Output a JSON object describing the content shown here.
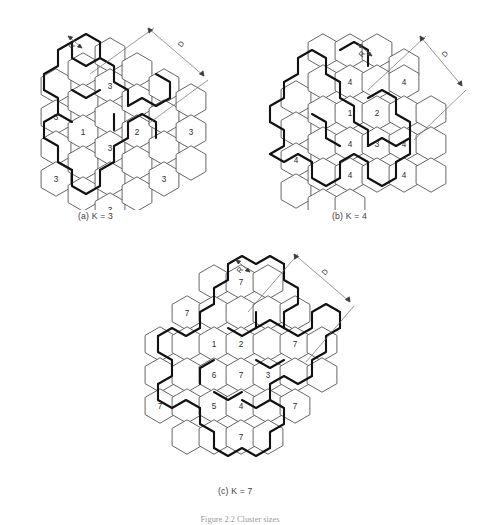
{
  "figure": {
    "caption": "Figure 2.2 Cluster sizes",
    "panels": [
      {
        "id": "a",
        "caption": "(a) K = 3",
        "cluster_size": 3,
        "dim_r_label": "R",
        "dim_d_label": "D",
        "origin": {
          "x": 8,
          "y": 14
        },
        "hex_radius": 17.2,
        "grid": {
          "col_step": 26.5,
          "row_step": 15.6
        },
        "cells": [
          {
            "cx": 48,
            "cy": 72,
            "label": ""
          },
          {
            "cx": 48,
            "cy": 103,
            "label": "3"
          },
          {
            "cx": 48,
            "cy": 134,
            "label": ""
          },
          {
            "cx": 48,
            "cy": 165,
            "label": "3"
          },
          {
            "cx": 75,
            "cy": 56,
            "label": ""
          },
          {
            "cx": 75,
            "cy": 87,
            "label": ""
          },
          {
            "cx": 75,
            "cy": 118,
            "label": "1"
          },
          {
            "cx": 75,
            "cy": 149,
            "label": ""
          },
          {
            "cx": 75,
            "cy": 180,
            "label": ""
          },
          {
            "cx": 102,
            "cy": 41,
            "label": ""
          },
          {
            "cx": 102,
            "cy": 72,
            "label": "3"
          },
          {
            "cx": 102,
            "cy": 103,
            "label": ""
          },
          {
            "cx": 102,
            "cy": 134,
            "label": "3"
          },
          {
            "cx": 102,
            "cy": 165,
            "label": ""
          },
          {
            "cx": 102,
            "cy": 196,
            "label": "3"
          },
          {
            "cx": 129,
            "cy": 56,
            "label": ""
          },
          {
            "cx": 129,
            "cy": 87,
            "label": ""
          },
          {
            "cx": 129,
            "cy": 118,
            "label": "2"
          },
          {
            "cx": 129,
            "cy": 149,
            "label": ""
          },
          {
            "cx": 129,
            "cy": 180,
            "label": ""
          },
          {
            "cx": 156,
            "cy": 72,
            "label": ""
          },
          {
            "cx": 156,
            "cy": 103,
            "label": ""
          },
          {
            "cx": 156,
            "cy": 134,
            "label": ""
          },
          {
            "cx": 156,
            "cy": 165,
            "label": "3"
          },
          {
            "cx": 183,
            "cy": 87,
            "label": ""
          },
          {
            "cx": 183,
            "cy": 118,
            "label": "3"
          },
          {
            "cx": 183,
            "cy": 149,
            "label": ""
          }
        ]
      },
      {
        "id": "b",
        "caption": "(b) K = 4",
        "cluster_size": 4,
        "dim_r_label": "R",
        "dim_d_label": "D",
        "origin": {
          "x": 248,
          "y": 10
        },
        "hex_radius": 17.2,
        "cells": [
          {
            "cx": 48,
            "cy": 88,
            "label": ""
          },
          {
            "cx": 48,
            "cy": 119,
            "label": ""
          },
          {
            "cx": 48,
            "cy": 150,
            "label": "4"
          },
          {
            "cx": 48,
            "cy": 181,
            "label": ""
          },
          {
            "cx": 75,
            "cy": 41,
            "label": ""
          },
          {
            "cx": 75,
            "cy": 72,
            "label": ""
          },
          {
            "cx": 75,
            "cy": 103,
            "label": ""
          },
          {
            "cx": 75,
            "cy": 134,
            "label": ""
          },
          {
            "cx": 75,
            "cy": 165,
            "label": ""
          },
          {
            "cx": 75,
            "cy": 196,
            "label": ""
          },
          {
            "cx": 102,
            "cy": 41,
            "label": ""
          },
          {
            "cx": 102,
            "cy": 72,
            "label": "4"
          },
          {
            "cx": 102,
            "cy": 103,
            "label": "1"
          },
          {
            "cx": 102,
            "cy": 134,
            "label": "4"
          },
          {
            "cx": 102,
            "cy": 165,
            "label": "4"
          },
          {
            "cx": 102,
            "cy": 196,
            "label": ""
          },
          {
            "cx": 129,
            "cy": 41,
            "label": ""
          },
          {
            "cx": 129,
            "cy": 72,
            "label": ""
          },
          {
            "cx": 129,
            "cy": 103,
            "label": "2"
          },
          {
            "cx": 129,
            "cy": 134,
            "label": "3"
          },
          {
            "cx": 129,
            "cy": 165,
            "label": ""
          },
          {
            "cx": 156,
            "cy": 56,
            "label": ""
          },
          {
            "cx": 156,
            "cy": 72,
            "label": "4"
          },
          {
            "cx": 156,
            "cy": 103,
            "label": ""
          },
          {
            "cx": 156,
            "cy": 134,
            "label": "4"
          },
          {
            "cx": 156,
            "cy": 165,
            "label": "4"
          },
          {
            "cx": 183,
            "cy": 103,
            "label": ""
          },
          {
            "cx": 183,
            "cy": 134,
            "label": ""
          },
          {
            "cx": 183,
            "cy": 165,
            "label": ""
          }
        ]
      },
      {
        "id": "c",
        "caption": "(c) K = 7",
        "cluster_size": 7,
        "dim_r_label": "R",
        "dim_d_label": "D",
        "origin": {
          "x": 120,
          "y": 232
        },
        "hex_radius": 17.2,
        "cells": [
          {
            "cx": 40,
            "cy": 112,
            "label": ""
          },
          {
            "cx": 40,
            "cy": 143,
            "label": ""
          },
          {
            "cx": 40,
            "cy": 174,
            "label": "7"
          },
          {
            "cx": 67,
            "cy": 81,
            "label": "7"
          },
          {
            "cx": 67,
            "cy": 112,
            "label": ""
          },
          {
            "cx": 67,
            "cy": 143,
            "label": ""
          },
          {
            "cx": 67,
            "cy": 174,
            "label": ""
          },
          {
            "cx": 67,
            "cy": 205,
            "label": ""
          },
          {
            "cx": 94,
            "cy": 50,
            "label": ""
          },
          {
            "cx": 94,
            "cy": 81,
            "label": ""
          },
          {
            "cx": 94,
            "cy": 112,
            "label": "1"
          },
          {
            "cx": 94,
            "cy": 143,
            "label": "6"
          },
          {
            "cx": 94,
            "cy": 174,
            "label": "5"
          },
          {
            "cx": 94,
            "cy": 205,
            "label": ""
          },
          {
            "cx": 121,
            "cy": 50,
            "label": "7"
          },
          {
            "cx": 121,
            "cy": 81,
            "label": ""
          },
          {
            "cx": 121,
            "cy": 112,
            "label": "2"
          },
          {
            "cx": 121,
            "cy": 143,
            "label": "7"
          },
          {
            "cx": 121,
            "cy": 174,
            "label": "4"
          },
          {
            "cx": 121,
            "cy": 205,
            "label": "7"
          },
          {
            "cx": 148,
            "cy": 50,
            "label": ""
          },
          {
            "cx": 148,
            "cy": 81,
            "label": ""
          },
          {
            "cx": 148,
            "cy": 112,
            "label": ""
          },
          {
            "cx": 148,
            "cy": 143,
            "label": "3"
          },
          {
            "cx": 148,
            "cy": 174,
            "label": ""
          },
          {
            "cx": 148,
            "cy": 205,
            "label": ""
          },
          {
            "cx": 175,
            "cy": 81,
            "label": ""
          },
          {
            "cx": 175,
            "cy": 112,
            "label": "7"
          },
          {
            "cx": 175,
            "cy": 143,
            "label": ""
          },
          {
            "cx": 175,
            "cy": 174,
            "label": "7"
          },
          {
            "cx": 202,
            "cy": 112,
            "label": ""
          },
          {
            "cx": 202,
            "cy": 143,
            "label": ""
          }
        ]
      }
    ]
  },
  "colors": {
    "cell_stroke": "#555555",
    "cluster_boundary": "#111111",
    "dimension_line": "#6d6d6d",
    "label_text": "#2b2b2b",
    "background": "#ffffff"
  }
}
